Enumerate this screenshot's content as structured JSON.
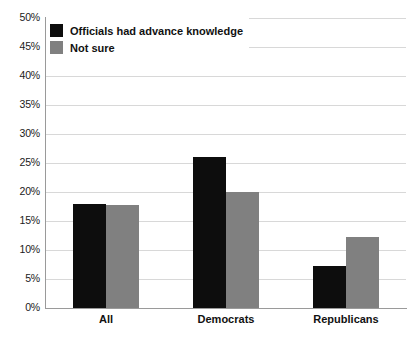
{
  "chart_data": {
    "type": "bar",
    "title": "",
    "subtitle": "",
    "xlabel": "",
    "ylabel": "",
    "categories": [
      "All",
      "Democrats",
      "Republicans"
    ],
    "series": [
      {
        "name": "Officials had advance knowledge",
        "color": "#0d0d0d",
        "values": [
          18,
          26,
          7.3
        ]
      },
      {
        "name": "Not sure",
        "color": "#808080",
        "values": [
          17.8,
          20,
          12.3
        ]
      }
    ],
    "ylim": [
      0,
      50
    ],
    "ytick_values": [
      0,
      5,
      10,
      15,
      20,
      25,
      30,
      35,
      40,
      45,
      50
    ],
    "ytick_labels": [
      "0%",
      "5%",
      "10%",
      "15%",
      "20%",
      "25%",
      "30%",
      "35%",
      "40%",
      "45%",
      "50%"
    ],
    "grid": true,
    "grid_axis": "y",
    "legend_position": "top-left",
    "value_format": "percent",
    "background_color": "#ffffff",
    "gridline_color": "#d8d8d8",
    "axis_color": "#9a9a9a"
  },
  "legend": {
    "entries": [
      {
        "label": "Officials had advance knowledge",
        "swatch": "black-swatch"
      },
      {
        "label": "Not sure",
        "swatch": "gray-swatch"
      }
    ]
  }
}
